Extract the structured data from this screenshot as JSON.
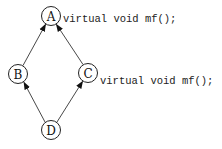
{
  "diagram": {
    "type": "inheritance-graph",
    "nodes": [
      {
        "id": "A",
        "label": "A",
        "cx": 51,
        "cy": 16
      },
      {
        "id": "B",
        "label": "B",
        "cx": 18,
        "cy": 74
      },
      {
        "id": "C",
        "label": "C",
        "cx": 88,
        "cy": 73
      },
      {
        "id": "D",
        "label": "D",
        "cx": 51,
        "cy": 130
      }
    ],
    "edges": [
      {
        "from": "B",
        "to": "A"
      },
      {
        "from": "C",
        "to": "A"
      },
      {
        "from": "D",
        "to": "B"
      },
      {
        "from": "D",
        "to": "C"
      }
    ],
    "annotations": {
      "a": "virtual void mf();",
      "c": "virtual void mf();"
    }
  }
}
